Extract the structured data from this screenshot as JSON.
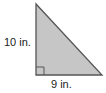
{
  "figure": {
    "shape": "right-triangle",
    "fill_color": "#c6c6c6",
    "stroke_color": "#555555",
    "labels": {
      "vertical_leg": "10 in.",
      "horizontal_leg": "9 in."
    },
    "right_angle_marker": true
  }
}
